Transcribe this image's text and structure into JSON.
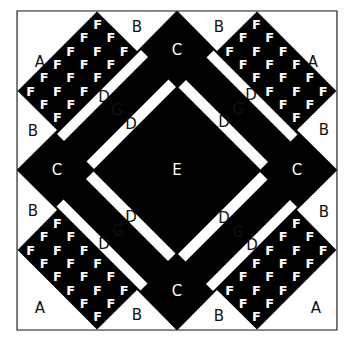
{
  "diagram": {
    "colors": {
      "dark": "#000000",
      "light": "#ffffff",
      "border": "#333333"
    },
    "labels": {
      "A": "A",
      "B": "B",
      "C": "C",
      "D": "D",
      "E": "E",
      "F": "F",
      "G": "G"
    },
    "regions": {
      "A": [
        "top-left corner",
        "top-right corner",
        "bottom-left corner",
        "bottom-right corner"
      ],
      "B": [
        "top-left",
        "top-right",
        "left-upper",
        "right-upper",
        "left-lower",
        "right-lower",
        "bottom-left",
        "bottom-right"
      ],
      "C": [
        "top",
        "left",
        "right",
        "bottom"
      ],
      "D": [
        "outer strips x4",
        "inner strips x4"
      ],
      "E": [
        "center square"
      ],
      "F": [
        "corner diamonds x4, 18 F pieces each"
      ],
      "G": [
        "bands between D strips x4"
      ]
    }
  }
}
